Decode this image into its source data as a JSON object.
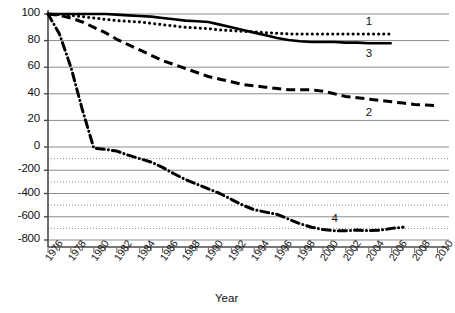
{
  "chart_data": {
    "type": "line",
    "title": "",
    "xlabel": "Year",
    "ylabel": "",
    "grid": true,
    "legend_position": "inline-end-of-line",
    "x_axis": {
      "min": 1976,
      "max": 2011,
      "major_tick_step": 2,
      "minor_tick_step": 1,
      "tick_labels": [
        "1976",
        "1978",
        "1980",
        "1982",
        "1984",
        "1986",
        "1988",
        "1990",
        "1992",
        "1994",
        "1996",
        "1998",
        "2000",
        "2002",
        "2004",
        "2006",
        "2008",
        "2010"
      ],
      "tick_values": [
        1976,
        1978,
        1980,
        1982,
        1984,
        1986,
        1988,
        1990,
        1992,
        1994,
        1996,
        1998,
        2000,
        2002,
        2004,
        2006,
        2008,
        2010
      ]
    },
    "y_axis": {
      "note": "non-linear: 0 to 100 segment is expanded, negative segment compressed",
      "tick_labels": [
        "100",
        "80",
        "60",
        "40",
        "20",
        "0",
        "-200",
        "-400",
        "-600",
        "-800"
      ],
      "tick_values": [
        100,
        80,
        60,
        40,
        20,
        0,
        -200,
        -400,
        -600,
        -800
      ],
      "minor_dotted_gridlines": [
        -100,
        -300,
        -500,
        -700
      ],
      "min": -800,
      "max": 100
    },
    "series": [
      {
        "name": "1",
        "label": "1",
        "style": "dotted",
        "color": "#000000",
        "x": [
          1976,
          1977,
          1978,
          1979,
          1980,
          1981,
          1982,
          1983,
          1984,
          1985,
          1986,
          1987,
          1988,
          1989,
          1990,
          1991,
          1992,
          1993,
          1994,
          1995,
          1996,
          1997,
          1998,
          1999,
          2000,
          2001,
          2002,
          2003,
          2004,
          2005,
          2006
        ],
        "values": [
          100,
          99.5,
          99,
          98,
          97,
          96,
          95,
          94.5,
          94,
          93,
          92,
          91,
          90,
          89.5,
          89,
          88,
          87.5,
          87,
          86.5,
          86,
          85.5,
          85,
          85,
          85,
          85,
          85,
          85,
          85,
          85,
          85,
          85
        ]
      },
      {
        "name": "2",
        "label": "2",
        "style": "dashed",
        "color": "#000000",
        "x": [
          1976,
          1977,
          1978,
          1979,
          1980,
          1981,
          1982,
          1983,
          1984,
          1985,
          1986,
          1987,
          1988,
          1989,
          1990,
          1991,
          1992,
          1993,
          1994,
          1995,
          1996,
          1997,
          1998,
          1999,
          2000,
          2001,
          2002,
          2003,
          2004,
          2005,
          2006,
          2007,
          2008,
          2009,
          2010
        ],
        "values": [
          100,
          99,
          97,
          94,
          90,
          86,
          81,
          77,
          73,
          69,
          65,
          62,
          59,
          56,
          53,
          51,
          49,
          47,
          46,
          45,
          44,
          43,
          43,
          43,
          42,
          40,
          38,
          37,
          36,
          35,
          34,
          33,
          32,
          31.5,
          31
        ]
      },
      {
        "name": "3",
        "label": "3",
        "style": "solid",
        "color": "#000000",
        "x": [
          1976,
          1977,
          1978,
          1979,
          1980,
          1981,
          1982,
          1983,
          1984,
          1985,
          1986,
          1987,
          1988,
          1989,
          1990,
          1991,
          1992,
          1993,
          1994,
          1995,
          1996,
          1997,
          1998,
          1999,
          2000,
          2001,
          2002,
          2003,
          2004,
          2005,
          2006
        ],
        "values": [
          100,
          100,
          100,
          100,
          100,
          100,
          99.5,
          99,
          98.5,
          98,
          97,
          96,
          95,
          94.5,
          94,
          92,
          90,
          88,
          86,
          84,
          82,
          80.5,
          79.5,
          79,
          79,
          79,
          78.5,
          78.5,
          78,
          78,
          78
        ]
      },
      {
        "name": "4",
        "label": "4",
        "style": "dash-dot",
        "color": "#000000",
        "x": [
          1976,
          1977,
          1978,
          1979,
          1980,
          1981,
          1982,
          1983,
          1984,
          1985,
          1986,
          1987,
          1988,
          1989,
          1990,
          1991,
          1992,
          1993,
          1994,
          1995,
          1996,
          1997,
          1998,
          1999,
          2000,
          2001,
          2002,
          2003,
          2004,
          2005,
          2006,
          2007
        ],
        "values": [
          100,
          85,
          60,
          28,
          -10,
          -20,
          -35,
          -70,
          -100,
          -130,
          -175,
          -230,
          -280,
          -320,
          -360,
          -400,
          -450,
          -500,
          -540,
          -560,
          -580,
          -620,
          -660,
          -690,
          -710,
          -720,
          -720,
          -715,
          -720,
          -715,
          -700,
          -690
        ]
      }
    ],
    "annotations": [
      {
        "text": "1",
        "series": "1",
        "x": 2004,
        "y": 85,
        "position": "above"
      },
      {
        "text": "2",
        "series": "2",
        "x": 2004,
        "y": 34,
        "position": "below"
      },
      {
        "text": "3",
        "series": "3",
        "x": 2004,
        "y": 78,
        "position": "below"
      },
      {
        "text": "4",
        "series": "4",
        "x": 2001,
        "y": -720,
        "position": "above"
      }
    ]
  }
}
